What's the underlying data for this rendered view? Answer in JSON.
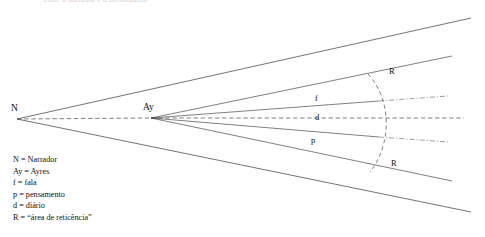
{
  "figure": {
    "clipped_heading": "entre o narrador e o personagem",
    "vertices": [
      {
        "id": "N",
        "label": "N",
        "x": 17,
        "y": 119,
        "label_x": 11,
        "label_y": 105
      },
      {
        "id": "Ay",
        "label": "Ay",
        "x": 151,
        "y": 118,
        "label_x": 143,
        "label_y": 104
      }
    ],
    "ray_labels": [
      {
        "id": "f",
        "label": "f",
        "x": 315,
        "y": 96
      },
      {
        "id": "d",
        "label": "d",
        "x": 315,
        "y": 113
      },
      {
        "id": "p",
        "label": "p",
        "x": 311,
        "y": 136
      }
    ],
    "arc_labels": [
      {
        "id": "R-upper",
        "label": "R",
        "x": 389,
        "y": 69
      },
      {
        "id": "R-lower",
        "label": "R",
        "x": 391,
        "y": 160
      }
    ],
    "legend": {
      "items": [
        {
          "key": "N",
          "text": "N = Narrador"
        },
        {
          "key": "Ay",
          "text": "Ay = Ayres"
        },
        {
          "key": "f",
          "text": "f = fala"
        },
        {
          "key": "p",
          "text": "p = pensamento"
        },
        {
          "key": "d",
          "text": "d = diário"
        },
        {
          "key": "R",
          "text": "R = “área de reticência”"
        }
      ]
    },
    "colors": {
      "line": "#3a3a3a",
      "dashed_line": "#4a4a4a",
      "arc": "#555555",
      "text": "#111111",
      "background": "#ffffff"
    },
    "geometry": {
      "narrator_cone_upper_end": {
        "x": 471,
        "y": 18
      },
      "narrator_cone_lower_end": {
        "x": 471,
        "y": 212
      },
      "ayres_rays": [
        {
          "id": "ray-upper-outer",
          "end_x": 452,
          "end_y": 56
        },
        {
          "id": "ray-f",
          "end_x": 448,
          "end_y": 100
        },
        {
          "id": "ray-d",
          "end_x": 464,
          "end_y": 118
        },
        {
          "id": "ray-p",
          "end_x": 448,
          "end_y": 142
        },
        {
          "id": "ray-lower-outer",
          "end_x": 452,
          "end_y": 180
        }
      ],
      "reticence_arc": {
        "top_x": 368,
        "top_y": 74,
        "bottom_x": 370,
        "bottom_y": 172,
        "bulge_x": 390
      }
    }
  }
}
